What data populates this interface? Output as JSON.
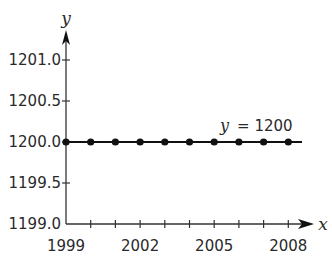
{
  "chart_data": {
    "type": "line",
    "title": "",
    "xlabel": "x",
    "ylabel": "y",
    "x": [
      1999,
      2000,
      2001,
      2002,
      2003,
      2004,
      2005,
      2006,
      2007,
      2008
    ],
    "series": [
      {
        "name": "y = 1200",
        "values": [
          1200,
          1200,
          1200,
          1200,
          1200,
          1200,
          1200,
          1200,
          1200,
          1200
        ]
      }
    ],
    "xlim": [
      1999,
      2008
    ],
    "ylim": [
      1199.0,
      1201.0
    ],
    "x_tick_labels": [
      "1999",
      "2002",
      "2005",
      "2008"
    ],
    "y_tick_labels": [
      "1201.0",
      "1200.5",
      "1200.0",
      "1199.5",
      "1199.0"
    ],
    "annotations": [
      {
        "text": "y = 1200",
        "var": "y",
        "eq": "= 1200"
      }
    ],
    "grid": false,
    "legend": "none",
    "markers": "filled-circle",
    "colors": {
      "line": "#111111",
      "axis": "#333333",
      "text": "#2a2a2a"
    }
  }
}
